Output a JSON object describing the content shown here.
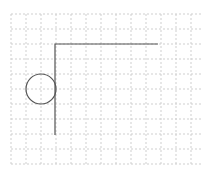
{
  "canvas": {
    "width": 215,
    "height": 176,
    "background": "#ffffff"
  },
  "grid": {
    "x0": 11,
    "y0": 14,
    "x1": 203,
    "y1": 165,
    "step": 15,
    "color": "#cfcfcf",
    "dash": "2,2"
  },
  "shapes": {
    "color": "#555555",
    "stroke_width": 1.2,
    "l_shape": {
      "points": [
        [
          158,
          44
        ],
        [
          55,
          44
        ],
        [
          55,
          135
        ]
      ]
    },
    "circle": {
      "cx": 41,
      "cy": 89,
      "r": 15
    }
  }
}
